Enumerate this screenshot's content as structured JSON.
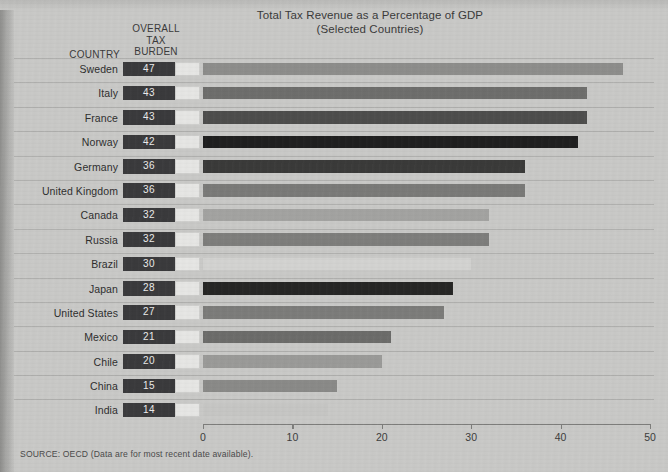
{
  "chart_data": {
    "type": "bar",
    "orientation": "horizontal",
    "title": "Total Tax Revenue as a Percentage of GDP",
    "subtitle": "(Selected Countries)",
    "xlabel": "",
    "ylabel": "",
    "xlim": [
      0,
      50
    ],
    "xticks": [
      0,
      10,
      20,
      30,
      40,
      50
    ],
    "xtick_labels": [
      "0",
      "10",
      "20",
      "30",
      "40",
      "50"
    ],
    "grid": false,
    "legend": null,
    "column_headers": {
      "country": "COUNTRY",
      "burden_line1": "OVERALL",
      "burden_line2": "TAX",
      "burden_line3": "BURDEN"
    },
    "categories": [
      "Sweden",
      "Italy",
      "France",
      "Norway",
      "Germany",
      "United Kingdom",
      "Canada",
      "Russia",
      "Brazil",
      "Japan",
      "United States",
      "Mexico",
      "Chile",
      "China",
      "India"
    ],
    "values": [
      47,
      43,
      43,
      42,
      36,
      36,
      32,
      32,
      30,
      28,
      27,
      21,
      20,
      15,
      14
    ],
    "rows": [
      {
        "country": "Sweden",
        "value": 47,
        "label": "47",
        "color": "#8d8d8b"
      },
      {
        "country": "Italy",
        "value": 43,
        "label": "43",
        "color": "#6e6e6c"
      },
      {
        "country": "France",
        "value": 43,
        "label": "43",
        "color": "#4d4d4c"
      },
      {
        "country": "Norway",
        "value": 42,
        "label": "42",
        "color": "#1f1f1f"
      },
      {
        "country": "Germany",
        "value": 36,
        "label": "36",
        "color": "#3a3a39"
      },
      {
        "country": "United Kingdom",
        "value": 36,
        "label": "36",
        "color": "#7a7a78"
      },
      {
        "country": "Canada",
        "value": 32,
        "label": "32",
        "color": "#a3a3a1"
      },
      {
        "country": "Russia",
        "value": 32,
        "label": "32",
        "color": "#7e7e7c"
      },
      {
        "country": "Brazil",
        "value": 30,
        "label": "30",
        "color": "#d3d3d1"
      },
      {
        "country": "Japan",
        "value": 28,
        "label": "28",
        "color": "#262625"
      },
      {
        "country": "United States",
        "value": 27,
        "label": "27",
        "color": "#7c7c7a"
      },
      {
        "country": "Mexico",
        "value": 21,
        "label": "21",
        "color": "#6c6c6a"
      },
      {
        "country": "Chile",
        "value": 20,
        "label": "20",
        "color": "#9a9a98"
      },
      {
        "country": "China",
        "value": 15,
        "label": "15",
        "color": "#8a8a88"
      },
      {
        "country": "India",
        "value": 14,
        "label": "14",
        "color": "#c6c6c4"
      }
    ]
  },
  "source_note": "SOURCE: OECD (Data are for most recent date available)."
}
